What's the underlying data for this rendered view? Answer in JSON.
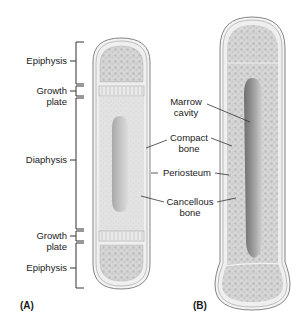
{
  "left_labels": {
    "epiphysis_top": "Epiphysis",
    "growth_plate_top_1": "Growth",
    "growth_plate_top_2": "plate",
    "diaphysis": "Diaphysis",
    "growth_plate_bottom_1": "Growth",
    "growth_plate_bottom_2": "plate",
    "epiphysis_bottom": "Epiphysis"
  },
  "middle_labels": {
    "marrow_cavity_1": "Marrow",
    "marrow_cavity_2": "cavity",
    "compact_bone_1": "Compact",
    "compact_bone_2": "bone",
    "periosteum": "Periosteum",
    "cancellous_bone_1": "Cancellous",
    "cancellous_bone_2": "bone"
  },
  "panels": {
    "a": "(A)",
    "b": "(B)"
  }
}
